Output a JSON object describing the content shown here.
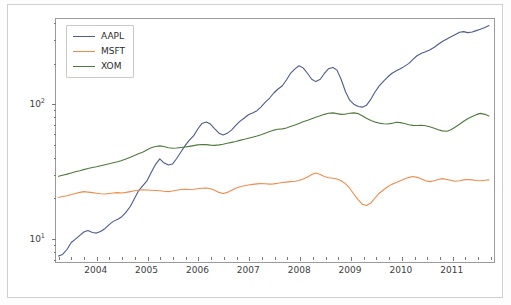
{
  "chart_data": {
    "type": "line",
    "title": "",
    "xlabel": "",
    "ylabel": "",
    "yscale": "log",
    "xscale": "linear",
    "grid": false,
    "legend_position": "upper left",
    "xlim": [
      2003.2,
      2011.85
    ],
    "ylim": [
      6.5,
      430
    ],
    "xticks": [
      "2004",
      "2005",
      "2006",
      "2007",
      "2008",
      "2009",
      "2010",
      "2011"
    ],
    "xtick_values": [
      2004,
      2005,
      2006,
      2007,
      2008,
      2009,
      2010,
      2011
    ],
    "ytick_labels": [
      "10¹",
      "10²"
    ],
    "ytick_values": [
      10,
      100
    ],
    "ytick_minor": [
      7,
      8,
      9,
      20,
      30,
      40,
      50,
      60,
      70,
      80,
      90,
      200,
      300,
      400
    ],
    "x": [
      2003.25,
      2003.33,
      2003.42,
      2003.5,
      2003.58,
      2003.67,
      2003.75,
      2003.83,
      2003.92,
      2004.0,
      2004.08,
      2004.17,
      2004.25,
      2004.33,
      2004.42,
      2004.5,
      2004.58,
      2004.67,
      2004.75,
      2004.83,
      2004.92,
      2005.0,
      2005.08,
      2005.17,
      2005.25,
      2005.33,
      2005.42,
      2005.5,
      2005.58,
      2005.67,
      2005.75,
      2005.83,
      2005.92,
      2006.0,
      2006.08,
      2006.17,
      2006.25,
      2006.33,
      2006.42,
      2006.5,
      2006.58,
      2006.67,
      2006.75,
      2006.83,
      2006.92,
      2007.0,
      2007.08,
      2007.17,
      2007.25,
      2007.33,
      2007.42,
      2007.5,
      2007.58,
      2007.67,
      2007.75,
      2007.83,
      2007.92,
      2008.0,
      2008.08,
      2008.17,
      2008.25,
      2008.33,
      2008.42,
      2008.5,
      2008.58,
      2008.67,
      2008.75,
      2008.83,
      2008.92,
      2009.0,
      2009.08,
      2009.17,
      2009.25,
      2009.33,
      2009.42,
      2009.5,
      2009.58,
      2009.67,
      2009.75,
      2009.83,
      2009.92,
      2010.0,
      2010.08,
      2010.17,
      2010.25,
      2010.33,
      2010.42,
      2010.5,
      2010.58,
      2010.67,
      2010.75,
      2010.83,
      2010.92,
      2011.0,
      2011.08,
      2011.17,
      2011.25,
      2011.33,
      2011.42,
      2011.5,
      2011.58,
      2011.67,
      2011.75
    ],
    "series": [
      {
        "name": "AAPL",
        "color": "#4c5b8c",
        "values": [
          7.2,
          7.4,
          8.1,
          9.1,
          9.6,
          10.3,
          10.9,
          11.2,
          10.8,
          10.7,
          11.0,
          11.6,
          12.4,
          13.1,
          13.6,
          14.2,
          15.3,
          17.0,
          19.4,
          22.2,
          24.4,
          26.5,
          30.4,
          35.2,
          38.5,
          36.0,
          34.6,
          35.2,
          38.6,
          43.5,
          48.4,
          53.0,
          57.5,
          64.5,
          70.8,
          72.8,
          70.2,
          65.0,
          60.0,
          58.2,
          59.8,
          63.5,
          68.5,
          73.5,
          78.0,
          82.5,
          85.0,
          88.5,
          94.5,
          102.0,
          110.0,
          120.0,
          128.0,
          136.0,
          150.0,
          168.0,
          182.0,
          192.0,
          185.0,
          168.0,
          152.0,
          146.0,
          152.0,
          168.0,
          182.0,
          186.0,
          178.0,
          152.0,
          122.0,
          106.0,
          99.0,
          95.0,
          94.0,
          97.0,
          108.0,
          122.0,
          135.0,
          147.0,
          158.0,
          168.0,
          176.0,
          182.0,
          190.0,
          200.0,
          214.0,
          228.0,
          238.0,
          244.0,
          252.0,
          264.0,
          278.0,
          292.0,
          305.0,
          316.0,
          328.0,
          342.0,
          346.0,
          340.0,
          344.0,
          352.0,
          360.0,
          372.0,
          384.0
        ]
      },
      {
        "name": "MSFT",
        "color": "#f08b4a",
        "values": [
          19.8,
          20.1,
          20.4,
          20.8,
          21.2,
          21.6,
          21.9,
          21.7,
          21.5,
          21.3,
          21.1,
          21.0,
          21.2,
          21.4,
          21.5,
          21.4,
          21.6,
          21.9,
          22.2,
          22.4,
          22.6,
          22.5,
          22.4,
          22.3,
          22.2,
          22.0,
          21.9,
          22.1,
          22.4,
          22.7,
          22.8,
          22.7,
          22.8,
          23.0,
          23.2,
          23.3,
          23.0,
          22.4,
          21.6,
          21.2,
          21.6,
          22.4,
          23.2,
          23.8,
          24.2,
          24.5,
          24.8,
          25.0,
          25.2,
          25.1,
          24.9,
          25.0,
          25.3,
          25.6,
          25.8,
          26.0,
          26.2,
          26.5,
          27.2,
          28.2,
          29.4,
          30.2,
          29.4,
          28.4,
          27.8,
          27.6,
          27.2,
          26.4,
          25.0,
          23.2,
          21.0,
          19.0,
          17.6,
          17.2,
          18.0,
          19.6,
          21.2,
          22.6,
          23.8,
          24.8,
          25.6,
          26.4,
          27.2,
          28.0,
          28.4,
          28.0,
          27.2,
          26.4,
          26.0,
          26.4,
          27.0,
          27.4,
          27.0,
          26.6,
          26.2,
          26.4,
          26.8,
          27.0,
          26.8,
          26.5,
          26.4,
          26.6,
          26.8
        ]
      },
      {
        "name": "XOM",
        "color": "#4f7a3c",
        "values": [
          28.5,
          29.0,
          29.6,
          30.2,
          30.8,
          31.4,
          32.0,
          32.6,
          33.2,
          33.6,
          34.2,
          34.8,
          35.4,
          36.0,
          36.6,
          37.4,
          38.4,
          39.6,
          40.8,
          42.0,
          43.4,
          45.0,
          46.6,
          47.6,
          48.2,
          47.6,
          46.6,
          46.2,
          46.4,
          46.8,
          47.2,
          47.8,
          48.4,
          49.0,
          49.4,
          49.2,
          48.8,
          48.6,
          49.0,
          49.6,
          50.4,
          51.2,
          52.0,
          53.0,
          54.0,
          55.0,
          56.0,
          57.2,
          58.4,
          60.0,
          61.8,
          63.2,
          64.2,
          64.6,
          65.6,
          67.2,
          69.0,
          71.0,
          73.0,
          75.0,
          77.0,
          79.0,
          81.0,
          83.0,
          84.6,
          85.2,
          84.0,
          83.0,
          83.4,
          84.6,
          85.2,
          84.0,
          81.0,
          77.6,
          74.6,
          72.6,
          71.4,
          70.6,
          70.2,
          71.0,
          72.4,
          72.0,
          70.8,
          69.4,
          68.6,
          68.4,
          68.8,
          68.2,
          67.0,
          65.4,
          63.6,
          62.4,
          62.0,
          63.6,
          66.4,
          70.0,
          73.6,
          77.0,
          80.0,
          82.6,
          84.4,
          83.0,
          80.6
        ]
      }
    ]
  },
  "legend": {
    "items": [
      {
        "label": "AAPL"
      },
      {
        "label": "MSFT"
      },
      {
        "label": "XOM"
      }
    ]
  }
}
